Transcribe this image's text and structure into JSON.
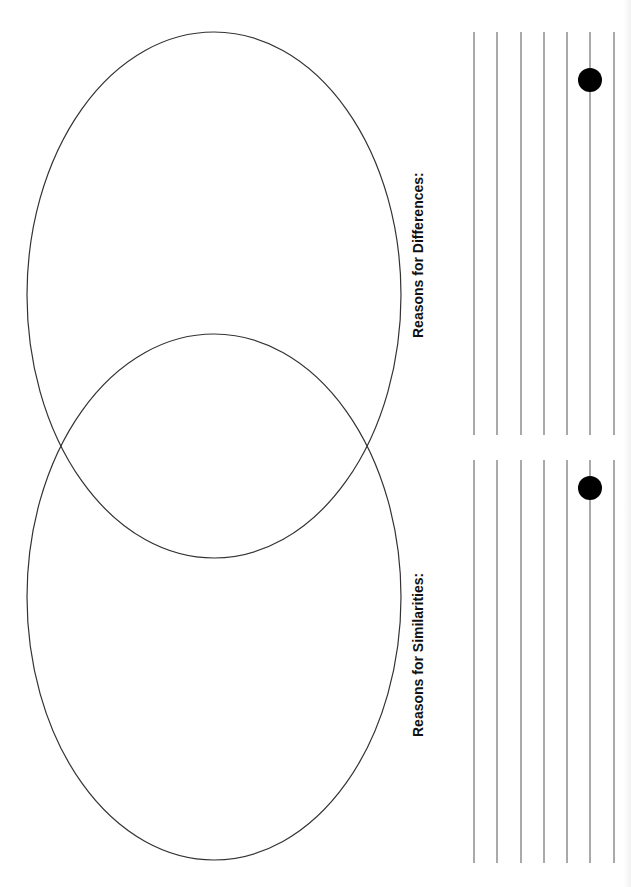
{
  "document": {
    "type": "Venn diagram worksheet (rotated, landscape layout)",
    "background": "#ffffff",
    "stroke_color": "#333333"
  },
  "venn": {
    "ellipses": [
      {
        "id": "top-circle",
        "cx": 214,
        "cy": 295,
        "rx": 187,
        "ry": 263
      },
      {
        "id": "bottom-circle",
        "cx": 214,
        "cy": 597,
        "rx": 187,
        "ry": 263
      }
    ]
  },
  "sections": [
    {
      "id": "differences",
      "label": "Reasons for Differences:",
      "label_x": 410,
      "label_y_center": 255,
      "lines_y_start": 32,
      "lines_y_end": 435,
      "bullet": {
        "cx": 590,
        "cy": 80,
        "r": 12
      }
    },
    {
      "id": "similarities",
      "label": "Reasons for Similarities:",
      "label_x": 410,
      "label_y_center": 655,
      "lines_y_start": 460,
      "lines_y_end": 863,
      "bullet": {
        "cx": 590,
        "cy": 488,
        "r": 12
      }
    }
  ],
  "writing_lines_x": [
    474,
    497,
    521,
    544,
    567,
    590,
    614
  ],
  "colors": {
    "line": "#555555",
    "bullet": "#000000",
    "text": "#111111"
  }
}
